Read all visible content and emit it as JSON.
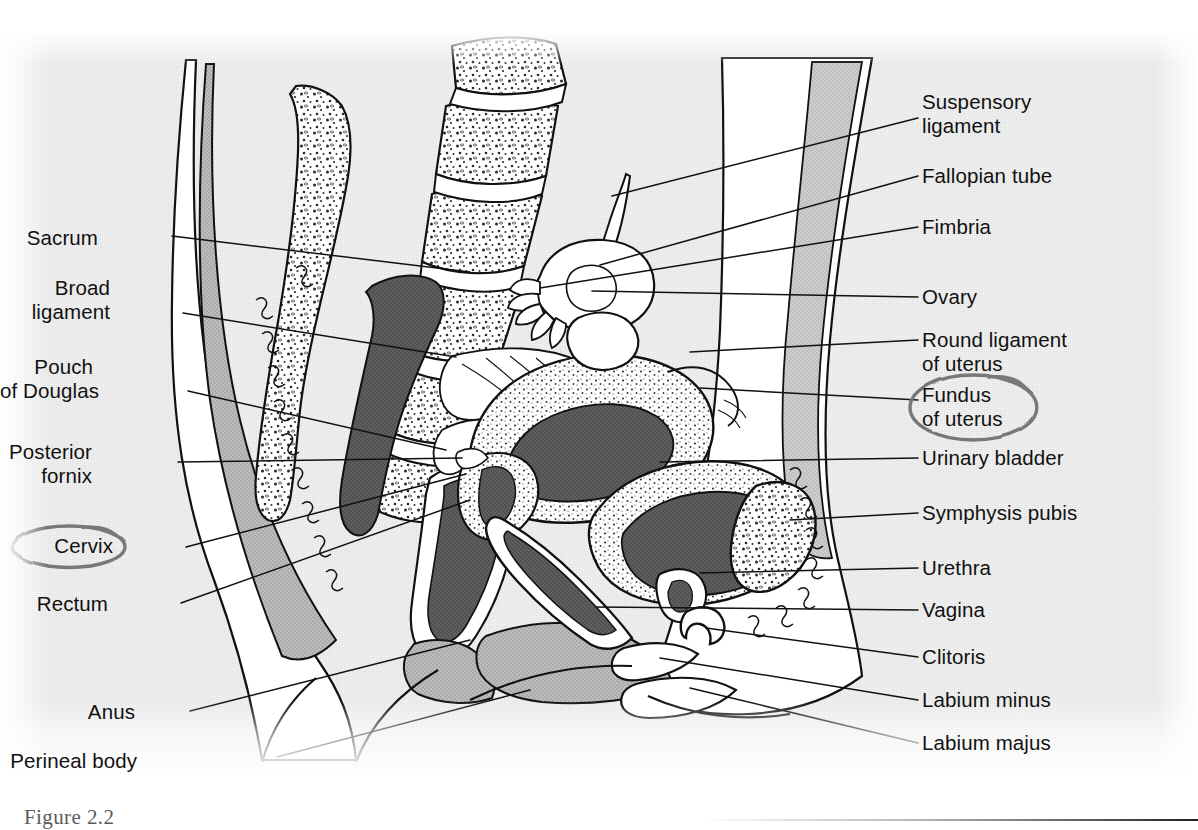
{
  "figure": {
    "caption": "Figure 2.2",
    "annotation_color": "#787878",
    "ink_color": "#111111",
    "paper_color": "#f2f2f2",
    "tones": {
      "muscle_gray": "#b9b9b9",
      "lumen_dark": "#5b5b5b",
      "bone_white": "#ffffff",
      "mid_gray": "#cfcfcf"
    }
  },
  "labels_left": [
    {
      "id": "sacrum",
      "lines": [
        "Sacrum"
      ],
      "x": 98,
      "y": 226,
      "leader": [
        [
          172,
          236
        ],
        [
          470,
          272
        ]
      ]
    },
    {
      "id": "broad-ligament",
      "lines": [
        "Broad",
        "ligament"
      ],
      "x": 110,
      "y": 276,
      "leader": [
        [
          183,
          313
        ],
        [
          456,
          357
        ]
      ]
    },
    {
      "id": "pouch-of-douglas",
      "lines": [
        "Pouch",
        "of Douglas"
      ],
      "x": 93,
      "y": 355,
      "leader": [
        [
          188,
          391
        ],
        [
          446,
          450
        ]
      ]
    },
    {
      "id": "posterior-fornix",
      "lines": [
        "Posterior",
        "fornix"
      ],
      "x": 92,
      "y": 440,
      "leader": [
        [
          178,
          462
        ],
        [
          462,
          458
        ]
      ]
    },
    {
      "id": "cervix",
      "lines": [
        "Cervix"
      ],
      "x": 113,
      "y": 534,
      "circled": true,
      "leader": [
        [
          186,
          547
        ],
        [
          466,
          474
        ]
      ]
    },
    {
      "id": "rectum",
      "lines": [
        "Rectum"
      ],
      "x": 108,
      "y": 592,
      "leader": [
        [
          181,
          603
        ],
        [
          470,
          500
        ]
      ]
    },
    {
      "id": "anus",
      "lines": [
        "Anus"
      ],
      "x": 135,
      "y": 700,
      "leader": [
        [
          190,
          711
        ],
        [
          470,
          640
        ]
      ]
    },
    {
      "id": "perineal-body",
      "lines": [
        "Perineal body"
      ],
      "x": 137,
      "y": 749,
      "leader": [
        [
          277,
          757
        ],
        [
          530,
          690
        ]
      ]
    }
  ],
  "labels_right": [
    {
      "id": "suspensory-ligament",
      "lines": [
        "Suspensory",
        "ligament"
      ],
      "x": 922,
      "y": 90,
      "leader": [
        [
          918,
          118
        ],
        [
          612,
          196
        ]
      ]
    },
    {
      "id": "fallopian-tube",
      "lines": [
        "Fallopian tube"
      ],
      "x": 922,
      "y": 164,
      "leader": [
        [
          918,
          176
        ],
        [
          600,
          265
        ]
      ]
    },
    {
      "id": "fimbria",
      "lines": [
        "Fimbria"
      ],
      "x": 922,
      "y": 215,
      "leader": [
        [
          918,
          227
        ],
        [
          540,
          288
        ]
      ]
    },
    {
      "id": "ovary",
      "lines": [
        "Ovary"
      ],
      "x": 922,
      "y": 285,
      "leader": [
        [
          918,
          297
        ],
        [
          592,
          291
        ]
      ]
    },
    {
      "id": "round-ligament",
      "lines": [
        "Round ligament",
        "of uterus"
      ],
      "x": 922,
      "y": 328,
      "leader": [
        [
          918,
          340
        ],
        [
          690,
          352
        ]
      ]
    },
    {
      "id": "fundus-of-uterus",
      "lines": [
        "Fundus",
        "of uterus"
      ],
      "x": 922,
      "y": 383,
      "circled": true,
      "leader": [
        [
          918,
          400
        ],
        [
          700,
          388
        ]
      ]
    },
    {
      "id": "urinary-bladder",
      "lines": [
        "Urinary bladder"
      ],
      "x": 922,
      "y": 446,
      "leader": [
        [
          918,
          458
        ],
        [
          660,
          462
        ]
      ]
    },
    {
      "id": "symphysis-pubis",
      "lines": [
        "Symphysis pubis"
      ],
      "x": 922,
      "y": 501,
      "leader": [
        [
          918,
          513
        ],
        [
          790,
          520
        ]
      ]
    },
    {
      "id": "urethra",
      "lines": [
        "Urethra"
      ],
      "x": 922,
      "y": 556,
      "leader": [
        [
          918,
          568
        ],
        [
          700,
          573
        ]
      ]
    },
    {
      "id": "vagina",
      "lines": [
        "Vagina"
      ],
      "x": 922,
      "y": 598,
      "leader": [
        [
          918,
          610
        ],
        [
          596,
          607
        ]
      ]
    },
    {
      "id": "clitoris",
      "lines": [
        "Clitoris"
      ],
      "x": 922,
      "y": 645,
      "leader": [
        [
          918,
          657
        ],
        [
          706,
          628
        ]
      ]
    },
    {
      "id": "labium-minus",
      "lines": [
        "Labium minus"
      ],
      "x": 922,
      "y": 688,
      "leader": [
        [
          918,
          700
        ],
        [
          660,
          658
        ]
      ]
    },
    {
      "id": "labium-majus",
      "lines": [
        "Labium majus"
      ],
      "x": 922,
      "y": 731,
      "leader": [
        [
          918,
          743
        ],
        [
          690,
          688
        ]
      ]
    }
  ]
}
